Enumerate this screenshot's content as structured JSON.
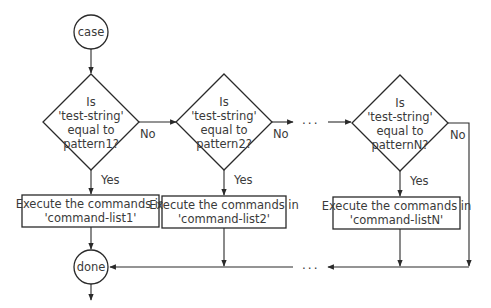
{
  "start": {
    "label": "case"
  },
  "end": {
    "label": "done"
  },
  "decisions": [
    {
      "line1": "Is",
      "line2": "'test-string'",
      "line3": "equal to",
      "line4": "pattern1?",
      "yes": "Yes",
      "no": "No"
    },
    {
      "line1": "Is",
      "line2": "'test-string'",
      "line3": "equal to",
      "line4": "pattern2?",
      "yes": "Yes",
      "no": "No"
    },
    {
      "line1": "Is",
      "line2": "'test-string'",
      "line3": "equal to",
      "line4": "patternN?",
      "yes": "Yes",
      "no": "No"
    }
  ],
  "actions": [
    {
      "line1": "Execute the commands in",
      "line2": "'command-list1'"
    },
    {
      "line1": "Execute the commands in",
      "line2": "'command-list2'"
    },
    {
      "line1": "Execute the commands in",
      "line2": "'command-listN'"
    }
  ],
  "ellipsis": "..."
}
